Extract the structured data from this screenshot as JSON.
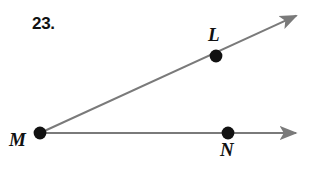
{
  "figure": {
    "problem_number": "23.",
    "background_color": "#ffffff",
    "line_color": "#7a7a7a",
    "point_color": "#111111",
    "label_color": "#111111",
    "width": 310,
    "height": 171,
    "points": [
      {
        "name": "M",
        "label": "M",
        "x": 40,
        "y": 133,
        "radius": 6,
        "label_x": 9,
        "label_y": 130,
        "role": "vertex"
      },
      {
        "name": "L",
        "label": "L",
        "x": 216,
        "y": 56,
        "radius": 6,
        "label_x": 208,
        "label_y": 25,
        "role": "ray-point"
      },
      {
        "name": "N",
        "label": "N",
        "x": 228,
        "y": 133,
        "radius": 6,
        "label_x": 220,
        "label_y": 140,
        "role": "ray-point"
      }
    ],
    "rays": [
      {
        "name": "ray-ML",
        "from": "M",
        "through": "L",
        "start_x": 40,
        "start_y": 133,
        "end_x": 300,
        "end_y": 14,
        "stroke_width": 2,
        "arrowhead": "end"
      },
      {
        "name": "ray-MN",
        "from": "M",
        "through": "N",
        "start_x": 40,
        "start_y": 133,
        "end_x": 300,
        "end_y": 133,
        "stroke_width": 2,
        "arrowhead": "end"
      }
    ]
  }
}
